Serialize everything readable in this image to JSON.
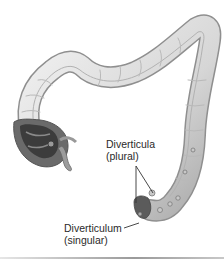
{
  "figure": {
    "labels": {
      "plural_term": "Diverticula",
      "plural_note": "(plural)",
      "singular_term": "Diverticulum",
      "singular_note": "(singular)"
    }
  },
  "colors": {
    "tissue_light": "#efefef",
    "tissue_mid": "#cfcfcf",
    "tissue_dark": "#8a8a8a",
    "interior_dark": "#3c3c3c",
    "text": "#2a2a2a",
    "leader_line": "#333333"
  }
}
